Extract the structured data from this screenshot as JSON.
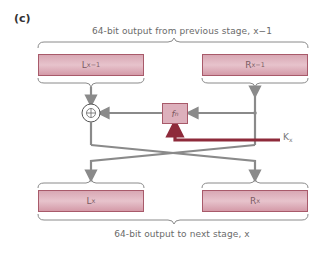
{
  "figure": {
    "panel_label": "(c)",
    "top_caption": "64-bit output from previous stage, x−1",
    "bottom_caption": "64-bit output to next stage, x"
  },
  "registers": {
    "left_in": {
      "base": "L",
      "sub": "x−1"
    },
    "right_in": {
      "base": "R",
      "sub": "x−1"
    },
    "left_out": {
      "base": "L",
      "sub": "x"
    },
    "right_out": {
      "base": "R",
      "sub": "x"
    }
  },
  "function": {
    "base": "f",
    "sub": "n"
  },
  "key": {
    "base": "K",
    "sub": "x"
  },
  "operator": {
    "symbol": "⊕",
    "name": "XOR"
  },
  "colors": {
    "register_fill": "#e0b4c0",
    "register_border": "#a85a6a",
    "line_gray": "#8a8a8a",
    "key_line": "#8e2a3a",
    "text": "#6a6a6a"
  }
}
